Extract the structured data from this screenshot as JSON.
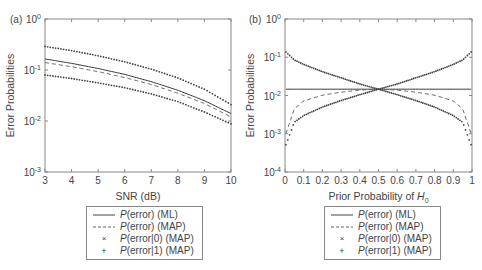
{
  "chart_data": [
    {
      "type": "line",
      "panel_label": "(a)",
      "title": "",
      "xlabel": "SNR (dB)",
      "ylabel": "Error Probabilities",
      "yscale": "log",
      "xlim": [
        3,
        10
      ],
      "ylim": [
        0.001,
        1
      ],
      "x_ticks": [
        "3",
        "4",
        "5",
        "6",
        "7",
        "8",
        "9",
        "10"
      ],
      "y_ticks": [
        "10^0",
        "10^-1",
        "10^-2",
        "10^-3"
      ],
      "grid": false,
      "legend_position": "below",
      "x": [
        3,
        4,
        5,
        6,
        7,
        8,
        9,
        10
      ],
      "series": [
        {
          "name": "P(error) (ML)",
          "style": "solid",
          "values": [
            0.165,
            0.135,
            0.107,
            0.082,
            0.059,
            0.04,
            0.025,
            0.014
          ]
        },
        {
          "name": "P(error) (MAP)",
          "style": "dashed",
          "values": [
            0.14,
            0.116,
            0.093,
            0.071,
            0.052,
            0.035,
            0.022,
            0.012
          ]
        },
        {
          "name": "P(error|0) (MAP)",
          "style": "x-markers",
          "values": [
            0.29,
            0.24,
            0.19,
            0.145,
            0.104,
            0.07,
            0.042,
            0.021
          ]
        },
        {
          "name": "P(error|1) (MAP)",
          "style": "plus-markers",
          "values": [
            0.08,
            0.068,
            0.056,
            0.045,
            0.034,
            0.024,
            0.015,
            0.0088
          ]
        }
      ]
    },
    {
      "type": "line",
      "panel_label": "(b)",
      "title": "",
      "xlabel": "Prior Probability of H0",
      "ylabel": "Error Probabilities",
      "yscale": "log",
      "xlim": [
        0,
        1
      ],
      "ylim": [
        0.0001,
        1
      ],
      "x_ticks": [
        "0",
        "0.1",
        "0.2",
        "0.3",
        "0.4",
        "0.5",
        "0.6",
        "0.7",
        "0.8",
        "0.9",
        "1"
      ],
      "y_ticks": [
        "10^0",
        "10^-1",
        "10^-2",
        "10^-3",
        "10^-4"
      ],
      "grid": false,
      "legend_position": "below",
      "x": [
        0.01,
        0.05,
        0.1,
        0.2,
        0.3,
        0.4,
        0.5,
        0.6,
        0.7,
        0.8,
        0.9,
        0.95,
        0.99
      ],
      "series": [
        {
          "name": "P(error) (ML)",
          "style": "solid",
          "values": [
            0.0146,
            0.0146,
            0.0146,
            0.0146,
            0.0146,
            0.0146,
            0.0146,
            0.0146,
            0.0146,
            0.0146,
            0.0146,
            0.0146,
            0.0146
          ]
        },
        {
          "name": "P(error) (MAP)",
          "style": "dashed",
          "values": [
            0.0012,
            0.0045,
            0.0072,
            0.0102,
            0.0122,
            0.0138,
            0.0146,
            0.0138,
            0.0122,
            0.0102,
            0.0072,
            0.0045,
            0.0012
          ]
        },
        {
          "name": "P(error|0) (MAP)",
          "style": "x-markers",
          "values": [
            0.13,
            0.085,
            0.065,
            0.042,
            0.029,
            0.02,
            0.0146,
            0.0105,
            0.0074,
            0.005,
            0.003,
            0.002,
            0.0006
          ]
        },
        {
          "name": "P(error|1) (MAP)",
          "style": "plus-markers",
          "values": [
            0.0006,
            0.002,
            0.003,
            0.005,
            0.0074,
            0.0105,
            0.0146,
            0.02,
            0.029,
            0.042,
            0.065,
            0.085,
            0.13
          ]
        }
      ]
    }
  ],
  "legend": {
    "items": [
      {
        "prefix": "P",
        "text": "(error) (ML)",
        "symbol": "solid-line"
      },
      {
        "prefix": "P",
        "text": "(error) (MAP)",
        "symbol": "dashed-line"
      },
      {
        "prefix": "P",
        "text": "(error|0) (MAP)",
        "symbol": "x-marker"
      },
      {
        "prefix": "P",
        "text": "(error|1) (MAP)",
        "symbol": "plus-marker"
      }
    ]
  },
  "colors": {
    "axis": "#888888",
    "curve": "#333333",
    "text": "#444444"
  }
}
